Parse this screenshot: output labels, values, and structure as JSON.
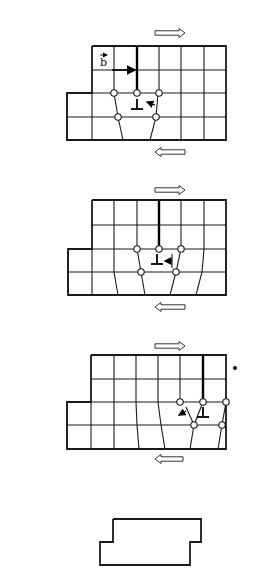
{
  "figure": {
    "colors": {
      "line": "#1a1a1a",
      "background": "#ffffff",
      "node_fill": "#ffffff"
    },
    "panels": [
      {
        "id": "stage-1",
        "top_arrow": {
          "x1": 155,
          "x2": 185,
          "y": 33,
          "direction": "right"
        },
        "bottom_arrow": {
          "x1": 185,
          "x2": 155,
          "y": 152,
          "direction": "left"
        },
        "outline": [
          [
            92,
            46
          ],
          [
            226,
            46
          ],
          [
            226,
            140
          ],
          [
            67,
            140
          ],
          [
            67,
            93
          ],
          [
            92,
            93
          ],
          [
            92,
            46
          ]
        ],
        "rows": [
          46,
          70,
          93,
          117,
          140
        ],
        "upper_cols": [
          92,
          114,
          137,
          159,
          181,
          204,
          226
        ],
        "lower_lines": [
          [
            [
              92,
              93
            ],
            [
              92,
              140
            ]
          ],
          [
            [
              114,
              93
            ],
            [
              118,
              117
            ],
            [
              123,
              140
            ]
          ],
          [
            [
              159,
              117
            ],
            [
              159,
              117
            ]
          ],
          [
            [
              158,
              93
            ],
            [
              156,
              117
            ],
            [
              150,
              140
            ]
          ],
          [
            [
              181,
              93
            ],
            [
              181,
              140
            ]
          ],
          [
            [
              204,
              93
            ],
            [
              204,
              140
            ]
          ]
        ],
        "dislocation": {
          "x": 137,
          "y_top": 46,
          "y_bottom": 93,
          "tee_x": 137,
          "tee_y": 109
        },
        "nodes": [
          [
            114,
            93
          ],
          [
            137,
            93
          ],
          [
            159,
            93
          ],
          [
            118,
            117
          ],
          [
            156,
            117
          ]
        ],
        "burgers": {
          "label": "b",
          "label_x": 100,
          "label_y": 66,
          "arrow_x1": 112,
          "arrow_x2": 135,
          "arrow_y": 70
        },
        "motion_arrow": {
          "x1": 155,
          "y1": 105,
          "x2": 147,
          "y2": 102
        },
        "extra_lower_diag": [
          [
            114,
            93
          ],
          [
            118,
            117
          ],
          [
            123,
            140
          ]
        ],
        "extra_lower_diag2": [
          [
            159,
            93
          ],
          [
            156,
            117
          ],
          [
            150,
            140
          ]
        ]
      },
      {
        "id": "stage-2",
        "top_arrow": {
          "x1": 155,
          "x2": 185,
          "y": 190,
          "direction": "right"
        },
        "bottom_arrow": {
          "x1": 185,
          "x2": 155,
          "y": 307,
          "direction": "left"
        },
        "outline": [
          [
            92,
            200
          ],
          [
            226,
            200
          ],
          [
            226,
            295
          ],
          [
            68,
            295
          ],
          [
            68,
            249
          ],
          [
            92,
            249
          ],
          [
            92,
            200
          ]
        ],
        "rows": [
          200,
          225,
          249,
          272,
          295
        ],
        "upper_cols": [
          92,
          114,
          137,
          159,
          181,
          204,
          226
        ],
        "lower_lines": [
          [
            [
              92,
              249
            ],
            [
              92,
              295
            ]
          ],
          [
            [
              114,
              249
            ],
            [
              114,
              272
            ],
            [
              118,
              295
            ]
          ],
          [
            [
              137,
              249
            ],
            [
              141,
              272
            ],
            [
              145,
              295
            ]
          ],
          [
            [
              181,
              249
            ],
            [
              176,
              272
            ],
            [
              170,
              295
            ]
          ],
          [
            [
              204,
              249
            ],
            [
              202,
              272
            ],
            [
              196,
              295
            ]
          ],
          [
            [
              226,
              249
            ],
            [
              226,
              295
            ]
          ]
        ],
        "dislocation": {
          "x": 159,
          "y_top": 200,
          "y_bottom": 249,
          "tee_x": 157,
          "tee_y": 264
        },
        "nodes": [
          [
            137,
            249
          ],
          [
            159,
            249
          ],
          [
            181,
            249
          ],
          [
            141,
            272
          ],
          [
            176,
            272
          ]
        ],
        "motion_arrow": {
          "x1": 172,
          "y1": 261,
          "x2": 165,
          "y2": 261
        },
        "motion_stub": {
          "x1": 172,
          "y1": 254,
          "x2": 172,
          "y2": 268
        }
      },
      {
        "id": "stage-3",
        "top_arrow": {
          "x1": 155,
          "x2": 185,
          "y": 346,
          "direction": "right"
        },
        "bottom_arrow": {
          "x1": 183,
          "x2": 155,
          "y": 459,
          "direction": "left"
        },
        "outline": [
          [
            91,
            355
          ],
          [
            226,
            355
          ],
          [
            226,
            449
          ],
          [
            67,
            449
          ],
          [
            67,
            402
          ],
          [
            91,
            402
          ],
          [
            91,
            355
          ]
        ],
        "rows": [
          355,
          379,
          402,
          425,
          449
        ],
        "upper_cols": [
          91,
          114,
          136,
          158,
          180,
          203,
          226
        ],
        "lower_lines": [
          [
            [
              91,
              402
            ],
            [
              91,
              449
            ]
          ],
          [
            [
              114,
              402
            ],
            [
              114,
              449
            ]
          ],
          [
            [
              136,
              402
            ],
            [
              137,
              425
            ],
            [
              139,
              449
            ]
          ],
          [
            [
              158,
              402
            ],
            [
              161,
              425
            ],
            [
              165,
              449
            ]
          ],
          [
            [
              203,
              402
            ],
            [
              194,
              425
            ],
            [
              190,
              449
            ]
          ],
          [
            [
              226,
              402
            ],
            [
              222,
              425
            ],
            [
              218,
              449
            ]
          ]
        ],
        "dislocation": {
          "x": 203,
          "y_top": 355,
          "y_bottom": 402,
          "tee_x": 203,
          "tee_y": 417
        },
        "nodes": [
          [
            180,
            402
          ],
          [
            203,
            402
          ],
          [
            226,
            402
          ],
          [
            194,
            425
          ],
          [
            222,
            425
          ]
        ],
        "motion_arrow": {
          "x1": 186,
          "y1": 411,
          "x2": 179,
          "y2": 415
        },
        "motion_stub": {
          "x1": 186,
          "y1": 407,
          "x2": 194,
          "y2": 425
        },
        "dot": {
          "x": 235,
          "y": 368
        }
      }
    ],
    "final_outline": [
      [
        113,
        519
      ],
      [
        201,
        519
      ],
      [
        201,
        542
      ],
      [
        190,
        542
      ],
      [
        190,
        565
      ],
      [
        100,
        565
      ],
      [
        100,
        542
      ],
      [
        113,
        542
      ],
      [
        113,
        519
      ]
    ]
  }
}
